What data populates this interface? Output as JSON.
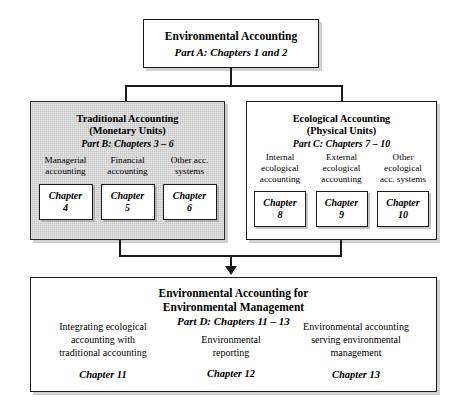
{
  "diagram": {
    "title_box": {
      "heading": "Environmental Accounting",
      "part": "Part A: Chapters 1 and 2"
    },
    "left_group": {
      "heading_line1": "Traditional Accounting",
      "heading_line2": "(Monetary Units)",
      "part": "Part B: Chapters 3 – 6",
      "columns": [
        {
          "label": "Managerial\naccounting",
          "chapter": "Chapter\n4"
        },
        {
          "label": "Financial\naccounting",
          "chapter": "Chapter\n5"
        },
        {
          "label": "Other acc.\nsystems",
          "chapter": "Chapter\n6"
        }
      ]
    },
    "right_group": {
      "heading_line1": "Ecological Accounting",
      "heading_line2": "(Physical Units)",
      "part": "Part C: Chapters 7 – 10",
      "columns": [
        {
          "label": "Internal\necological\naccounting",
          "chapter": "Chapter\n8"
        },
        {
          "label": "External\necological\naccounting",
          "chapter": "Chapter\n9"
        },
        {
          "label": "Other\necological\nacc. systems",
          "chapter": "Chapter\n10"
        }
      ]
    },
    "bottom_group": {
      "heading_line1": "Environmental Accounting for",
      "heading_line2": "Environmental Management",
      "part": "Part D: Chapters 11 – 13",
      "columns": [
        {
          "label": "Integrating ecological\naccounting with\ntraditional accounting",
          "chapter": "Chapter 11"
        },
        {
          "label": "Environmental\nreporting",
          "chapter": "Chapter 12"
        },
        {
          "label": "Environmental accounting\nserving environmental\nmanagement",
          "chapter": "Chapter 13"
        }
      ]
    },
    "colors": {
      "line": "#1a1a1a",
      "group_fill": "#c6c6c6",
      "box_fill": "#ffffff"
    }
  }
}
